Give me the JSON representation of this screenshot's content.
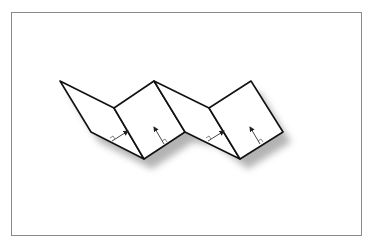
{
  "figure": {
    "panels": [
      {
        "name": "panel-1",
        "kind": "slanted"
      },
      {
        "name": "panel-2",
        "kind": "square"
      },
      {
        "name": "panel-3",
        "kind": "slanted"
      },
      {
        "name": "panel-4",
        "kind": "square"
      }
    ],
    "normals": 4,
    "caption": ""
  },
  "colors": {
    "stroke": "#111111",
    "fill": "#ffffff",
    "shadow": "#9a9a9a",
    "frame": "#8a8a8a",
    "normal": "#333333"
  }
}
